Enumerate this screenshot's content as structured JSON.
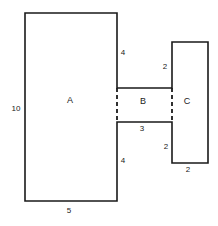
{
  "diagram": {
    "type": "geometry-figure",
    "stroke_color": "#1a1a1a",
    "fill_color": "#ffffff",
    "background_color": "#ffffff",
    "regions": [
      {
        "id": "A",
        "label": "A",
        "x": 70,
        "y": 100
      },
      {
        "id": "B",
        "label": "B",
        "x": 143,
        "y": 101
      },
      {
        "id": "C",
        "label": "C",
        "x": 187,
        "y": 101
      }
    ],
    "dimension_labels": [
      {
        "id": "a-left",
        "value": "10",
        "x": 10,
        "y": 104,
        "w": 12
      },
      {
        "id": "a-bottom",
        "value": "5",
        "x": 63,
        "y": 206,
        "w": 12
      },
      {
        "id": "a-right-top",
        "value": "4",
        "x": 118,
        "y": 48,
        "w": 10
      },
      {
        "id": "a-right-bottom",
        "value": "4",
        "x": 118,
        "y": 156,
        "w": 10
      },
      {
        "id": "b-bottom",
        "value": "3",
        "x": 137,
        "y": 124,
        "w": 10
      },
      {
        "id": "c-left-top",
        "value": "2",
        "x": 160,
        "y": 62,
        "w": 10
      },
      {
        "id": "c-left-bottom",
        "value": "2",
        "x": 161,
        "y": 142,
        "w": 10
      },
      {
        "id": "c-bottom",
        "value": "2",
        "x": 183,
        "y": 165,
        "w": 10
      }
    ],
    "geometry": {
      "outline_path": "M 25 13 L 117 13 L 117 88 L 172 88 L 172 42 L 208 42 L 208 163 L 172 163 L 172 122 L 117 122 L 117 201 L 25 201 Z",
      "dashed_segments": [
        {
          "id": "b-left-divider",
          "x1": 117,
          "y1": 88,
          "x2": 117,
          "y2": 122
        },
        {
          "id": "b-right-divider",
          "x1": 172,
          "y1": 88,
          "x2": 172,
          "y2": 122
        }
      ]
    }
  }
}
